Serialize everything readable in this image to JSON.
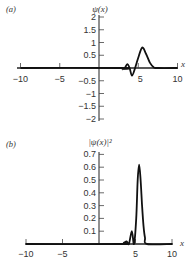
{
  "chart_data": [
    {
      "type": "line",
      "panel_label": "(a)",
      "title": "",
      "xlabel": "x",
      "ylabel": "ψ(x)",
      "xlim": [
        -10,
        10
      ],
      "ylim": [
        -2,
        2
      ],
      "x_ticks": [
        "-10",
        "-5",
        "5",
        "10"
      ],
      "y_ticks": [
        "2",
        "1.5",
        "1",
        "0.5",
        "-0.5",
        "-1",
        "-1.5",
        "-2"
      ],
      "grid": false,
      "series": [
        {
          "name": "ψ(x)",
          "x": [
            -10,
            2.8,
            3.0,
            3.3,
            3.6,
            3.9,
            4.2,
            4.6,
            5.0,
            5.5,
            6.0,
            6.5,
            7.0,
            7.5,
            10
          ],
          "y": [
            0,
            0,
            -0.05,
            0,
            0.15,
            0,
            -0.3,
            0,
            0.4,
            0.8,
            0.55,
            0.2,
            0.02,
            0,
            0
          ]
        }
      ]
    },
    {
      "type": "line",
      "panel_label": "(b)",
      "title": "",
      "xlabel": "x",
      "ylabel": "|ψ(x)|²",
      "xlim": [
        -10,
        10
      ],
      "ylim": [
        0,
        0.7
      ],
      "x_ticks": [
        "-10",
        "-5",
        "5",
        "10"
      ],
      "y_ticks": [
        "0.7",
        "0.6",
        "0.5",
        "0.4",
        "0.3",
        "0.2",
        "0.1"
      ],
      "grid": false,
      "series": [
        {
          "name": "|ψ(x)|²",
          "x": [
            -10,
            3.0,
            3.4,
            3.8,
            4.1,
            4.5,
            4.8,
            5.1,
            5.3,
            5.5,
            5.7,
            5.9,
            6.1,
            6.3,
            6.6,
            10
          ],
          "y": [
            0,
            0,
            0.01,
            0.02,
            0,
            0.1,
            0,
            0.2,
            0.5,
            0.62,
            0.5,
            0.3,
            0.14,
            0.05,
            0,
            0
          ]
        }
      ]
    }
  ]
}
